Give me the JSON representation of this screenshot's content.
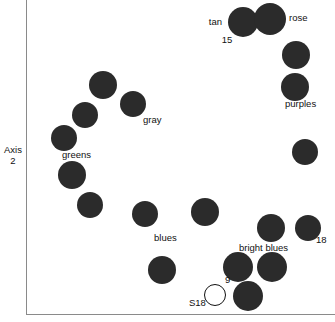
{
  "chart_data": {
    "type": "scatter",
    "title": "",
    "xlabel": "",
    "ylabel": "Axis 2",
    "grid": false,
    "legend": "none",
    "xlim": [
      0,
      335
    ],
    "ylim": [
      0,
      322
    ],
    "axis_labels": {
      "y_line1": "Axis",
      "y_line2": "2"
    },
    "note": "Point coordinates are in pixel space of the plotting frame; marker style 'filled' = solid dark disc, 'open' = unfilled outlined circle.",
    "points": [
      {
        "x": 103,
        "y": 85,
        "r": 14,
        "style": "filled",
        "label": ""
      },
      {
        "x": 133,
        "y": 104,
        "r": 13,
        "style": "filled",
        "label": "gray"
      },
      {
        "x": 85,
        "y": 115,
        "r": 13,
        "style": "filled",
        "label": ""
      },
      {
        "x": 64,
        "y": 138,
        "r": 13,
        "style": "filled",
        "label": "greens"
      },
      {
        "x": 72,
        "y": 175,
        "r": 14,
        "style": "filled",
        "label": ""
      },
      {
        "x": 90,
        "y": 205,
        "r": 13,
        "style": "filled",
        "label": ""
      },
      {
        "x": 145,
        "y": 214,
        "r": 13,
        "style": "filled",
        "label": "blues"
      },
      {
        "x": 205,
        "y": 212,
        "r": 14,
        "style": "filled",
        "label": ""
      },
      {
        "x": 162,
        "y": 270,
        "r": 14,
        "style": "filled",
        "label": ""
      },
      {
        "x": 215,
        "y": 295,
        "r": 11,
        "style": "open",
        "label": "S18"
      },
      {
        "x": 243,
        "y": 22,
        "r": 15,
        "style": "filled",
        "label": "tan"
      },
      {
        "x": 270,
        "y": 19,
        "r": 16,
        "style": "filled",
        "label": "rose"
      },
      {
        "x": 296,
        "y": 55,
        "r": 14,
        "style": "filled",
        "label": ""
      },
      {
        "x": 295,
        "y": 87,
        "r": 14,
        "style": "filled",
        "label": "purples"
      },
      {
        "x": 305,
        "y": 152,
        "r": 13,
        "style": "filled",
        "label": ""
      },
      {
        "x": 271,
        "y": 228,
        "r": 14,
        "style": "filled",
        "label": "bright blues"
      },
      {
        "x": 308,
        "y": 228,
        "r": 13,
        "style": "filled",
        "label": "18"
      },
      {
        "x": 238,
        "y": 267,
        "r": 15,
        "style": "filled",
        "label": "9"
      },
      {
        "x": 272,
        "y": 267,
        "r": 15,
        "style": "filled",
        "label": ""
      },
      {
        "x": 248,
        "y": 296,
        "r": 15,
        "style": "filled",
        "label": ""
      }
    ],
    "annotations": [
      {
        "text": "tan",
        "x": 222,
        "y": 22,
        "anchor": "right"
      },
      {
        "text": "15",
        "x": 227,
        "y": 40,
        "anchor": "center"
      },
      {
        "text": "rose",
        "x": 289,
        "y": 18,
        "anchor": "left"
      },
      {
        "text": "purples",
        "x": 285,
        "y": 104,
        "anchor": "left"
      },
      {
        "text": "gray",
        "x": 143,
        "y": 120,
        "anchor": "left"
      },
      {
        "text": "greens",
        "x": 62,
        "y": 155,
        "anchor": "left"
      },
      {
        "text": "blues",
        "x": 154,
        "y": 238,
        "anchor": "left"
      },
      {
        "text": "bright blues",
        "x": 239,
        "y": 248,
        "anchor": "left"
      },
      {
        "text": "18",
        "x": 316,
        "y": 240,
        "anchor": "left"
      },
      {
        "text": "9",
        "x": 225,
        "y": 280,
        "anchor": "left"
      },
      {
        "text": "S18",
        "x": 189,
        "y": 303,
        "anchor": "left"
      }
    ]
  }
}
